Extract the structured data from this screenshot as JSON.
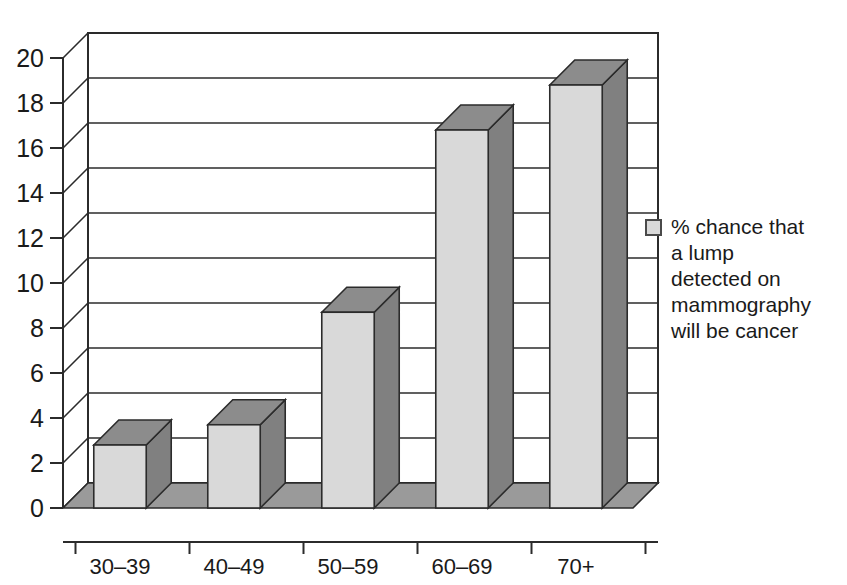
{
  "chart_data": {
    "type": "bar",
    "title": "",
    "subtitle": "",
    "xlabel": "",
    "ylabel": "",
    "categories": [
      "30–39",
      "40–49",
      "50–59",
      "60–69",
      "70+"
    ],
    "values": [
      2.8,
      3.7,
      8.7,
      16.8,
      18.8
    ],
    "series": [
      {
        "name": "% chance that a lump detected on mammography will be cancer",
        "values": [
          2.8,
          3.7,
          8.7,
          16.8,
          18.8
        ]
      }
    ],
    "ylim": [
      0,
      20
    ],
    "ytick_step": 2,
    "yticks": [
      "0",
      "2",
      "4",
      "6",
      "8",
      "10",
      "12",
      "14",
      "16",
      "18",
      "20"
    ],
    "grid": true,
    "grid_axis": "y",
    "legend_position": "right",
    "style": "3d-column",
    "annotations": []
  },
  "legend": {
    "swatch_name": "series-color-swatch",
    "label": "% chance that\na lump\ndetected on\nmammography\nwill be cancer"
  },
  "colors": {
    "background": "#ffffff",
    "bar_front": "#d9d9d9",
    "bar_side": "#808080",
    "bar_top": "#8c8c8c",
    "floor": "#9a9a9a",
    "axis": "#2b2b2b",
    "grid": "#2b2b2b",
    "text": "#1a1a1a"
  }
}
